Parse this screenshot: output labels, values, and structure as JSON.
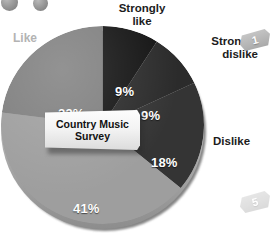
{
  "chart_data": {
    "type": "pie",
    "title": "Country Music Survey",
    "categories": [
      "Strongly like",
      "Strongly dislike",
      "Dislike",
      "Like (bottom segment)",
      "Like"
    ],
    "values": [
      9,
      9,
      18,
      41,
      23
    ],
    "value_labels": [
      "9%",
      "9%",
      "18%",
      "41%",
      "23%"
    ],
    "colors": [
      "#141414",
      "#2b2b2b",
      "#343434",
      "#9e9e9e",
      "#7e7e7e"
    ],
    "legend": "outside labels",
    "start_angle_deg": 0,
    "direction": "clockwise"
  },
  "chart": {
    "banner_title": "Country Music\nSurvey",
    "slices": [
      {
        "label": "Strongly like",
        "pct": "9%",
        "color": "#141414"
      },
      {
        "label": "Strongly dislike",
        "pct": "9%",
        "color": "#2b2b2b"
      },
      {
        "label": "Dislike",
        "pct": "18%",
        "color": "#343434"
      },
      {
        "label": "",
        "pct": "41%",
        "color": "#9e9e9e"
      },
      {
        "label": "Like",
        "pct": "23%",
        "color": "#7e7e7e"
      }
    ],
    "labels": {
      "strongly_like": "Strongly\nlike",
      "strongly_dislike": "Strongly\ndislike",
      "dislike": "Dislike",
      "like": "Like"
    }
  },
  "badges": {
    "top": "1",
    "bottom": "5"
  }
}
